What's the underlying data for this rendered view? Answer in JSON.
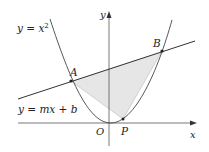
{
  "diagram": {
    "type": "geometry-figure",
    "labels": {
      "parabola": "y = x",
      "parabola_exp": "2",
      "line": "y = mx + b",
      "y_axis": "y",
      "x_axis": "x",
      "origin": "O",
      "point_a": "A",
      "point_b": "B",
      "point_p": "P"
    },
    "colors": {
      "stroke": "#333333",
      "fill_region": "#e6e6e6",
      "background": "#ffffff"
    },
    "elements": [
      "parabola y = x^2",
      "line y = mx + b",
      "shaded triangle APB",
      "points A, B on intersection",
      "point P on parabola between O and B"
    ]
  }
}
